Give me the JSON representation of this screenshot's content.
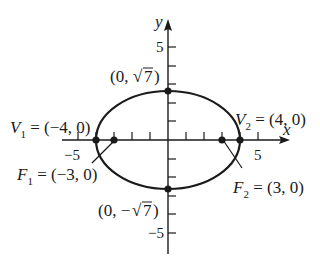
{
  "diagram": {
    "axes": {
      "x_label": "x",
      "y_label": "y",
      "x_tick_labels": {
        "neg": "−5",
        "pos": "5"
      },
      "y_tick_labels": {
        "pos": "5",
        "neg": "−5"
      }
    },
    "points": {
      "V1": {
        "name": "V",
        "sub": "1",
        "text": " = (−4, 0)",
        "x": -4,
        "y": 0
      },
      "V2": {
        "name": "V",
        "sub": "2",
        "text": " = (4, 0)",
        "x": 4,
        "y": 0
      },
      "F1": {
        "name": "F",
        "sub": "1",
        "text": " = (−3, 0)",
        "x": -3,
        "y": 0
      },
      "F2": {
        "name": "F",
        "sub": "2",
        "text": " =  (3, 0)",
        "x": 3,
        "y": 0
      },
      "top": {
        "text_pre": "(0, ",
        "radical": "√",
        "radicand": "7",
        "text_post": ")",
        "x": 0,
        "y": 2.6458
      },
      "bottom": {
        "text_pre": "(0, −",
        "radical": "√",
        "radicand": "7",
        "text_post": ")",
        "x": 0,
        "y": -2.6458
      }
    },
    "ellipse": {
      "a": 4,
      "b": 2.6458,
      "center": [
        0,
        0
      ]
    },
    "colors": {
      "stroke": "#1a1a1a",
      "background": "#ffffff"
    }
  }
}
